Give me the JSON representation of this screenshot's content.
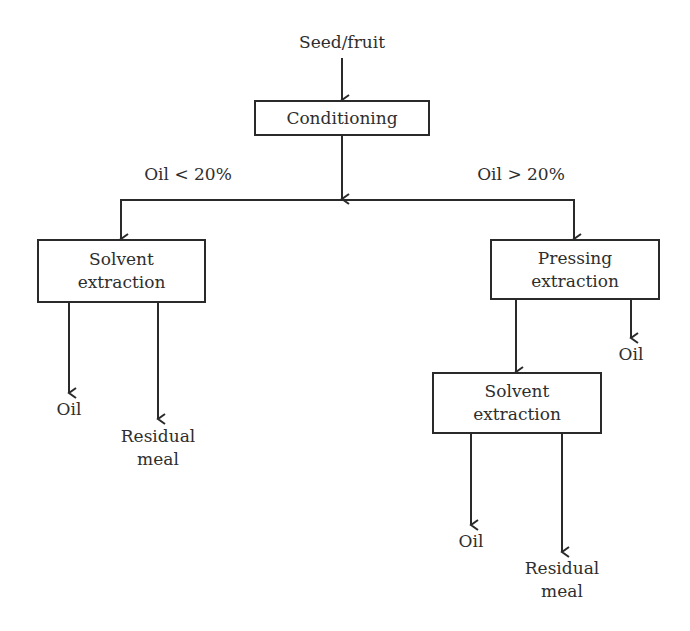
{
  "diagram": {
    "type": "flowchart",
    "title": "",
    "colors": {
      "background": "#ffffff",
      "line": "#2a2a2a",
      "text": "#2e2e2e"
    },
    "nodes": {
      "input": {
        "label": "Seed/fruit"
      },
      "conditioning": {
        "label": "Conditioning"
      },
      "solvent_left": {
        "line1": "Solvent",
        "line2": "extraction"
      },
      "pressing": {
        "line1": "Pressing",
        "line2": "extraction"
      },
      "solvent_right": {
        "line1": "Solvent",
        "line2": "extraction"
      },
      "oil_left": {
        "label": "Oil"
      },
      "meal_left": {
        "line1": "Residual",
        "line2": "meal"
      },
      "oil_press": {
        "label": "Oil"
      },
      "oil_right": {
        "label": "Oil"
      },
      "meal_right": {
        "line1": "Residual",
        "line2": "meal"
      }
    },
    "branches": {
      "low": {
        "label": "Oil < 20%"
      },
      "high": {
        "label": "Oil > 20%"
      }
    },
    "edges": [
      {
        "from": "input",
        "to": "conditioning"
      },
      {
        "from": "conditioning",
        "to": "solvent_left",
        "condition": "Oil < 20%"
      },
      {
        "from": "conditioning",
        "to": "pressing",
        "condition": "Oil > 20%"
      },
      {
        "from": "solvent_left",
        "to": "oil_left"
      },
      {
        "from": "solvent_left",
        "to": "meal_left"
      },
      {
        "from": "pressing",
        "to": "solvent_right"
      },
      {
        "from": "pressing",
        "to": "oil_press"
      },
      {
        "from": "solvent_right",
        "to": "oil_right"
      },
      {
        "from": "solvent_right",
        "to": "meal_right"
      }
    ]
  }
}
